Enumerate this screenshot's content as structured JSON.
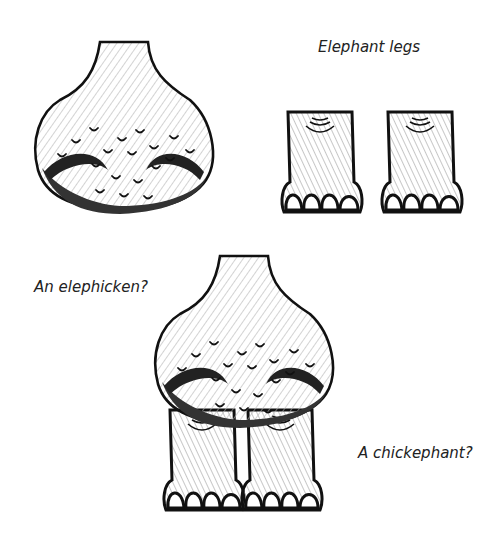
{
  "captions": {
    "top_right": "Elephant legs",
    "middle_left": "An elephicken?",
    "bottom_right": "A chickephant?"
  },
  "figures": [
    {
      "name": "chicken-body",
      "description": "feathered chicken body, top left"
    },
    {
      "name": "elephant-legs",
      "description": "two elephant legs, top right"
    },
    {
      "name": "elephicken",
      "description": "chicken body on elephant legs, bottom center"
    }
  ],
  "colors": {
    "ink": "#111111",
    "shade": "#9a9a9a",
    "background": "#ffffff"
  }
}
